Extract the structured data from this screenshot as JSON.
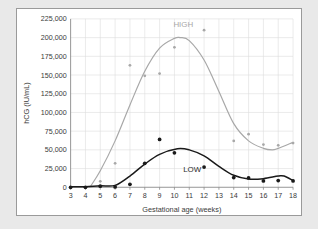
{
  "panel": {
    "background": "#ffffff",
    "border_color": "#9a9a9a",
    "page_background": "#e9e9e9"
  },
  "chart_data": {
    "type": "scatter",
    "title": "",
    "xlabel": "Gestational age (weeks)",
    "ylabel": "hCG (IU/mL)",
    "xlim": [
      3,
      18
    ],
    "ylim": [
      0,
      225000
    ],
    "xticks": [
      3,
      4,
      5,
      6,
      7,
      8,
      9,
      10,
      11,
      12,
      13,
      14,
      15,
      16,
      17,
      18
    ],
    "yticks": [
      0,
      25000,
      50000,
      75000,
      100000,
      125000,
      150000,
      175000,
      200000,
      225000
    ],
    "ytick_labels": [
      "0",
      "25,000",
      "50,000",
      "75,000",
      "100,000",
      "125,000",
      "150,000",
      "175,000",
      "200,000",
      "225,000"
    ],
    "grid": true,
    "grid_color": "#dedede",
    "legend": "inline-annotations",
    "annotations": [
      {
        "text": "HIGH",
        "x": 10.6,
        "y": 214000,
        "color": "#a8a8a8"
      },
      {
        "text": "LOW",
        "x": 11.2,
        "y": 21000,
        "color": "#2b2b2b"
      }
    ],
    "series": [
      {
        "name": "HIGH",
        "color": "#a8a8a8",
        "marker": "dot",
        "x": [
          3,
          4,
          5,
          6,
          7,
          8,
          9,
          10,
          12,
          14,
          15,
          16,
          17,
          18
        ],
        "values": [
          0,
          0,
          8000,
          32000,
          163000,
          149000,
          152000,
          187000,
          210000,
          62000,
          71000,
          57000,
          56000,
          59000
        ],
        "trend": {
          "type": "smooth",
          "x": [
            4.3,
            5,
            6,
            7,
            8,
            9,
            10,
            10.4,
            11,
            12,
            13,
            14,
            15,
            16,
            16.6,
            17,
            18
          ],
          "values": [
            0,
            22000,
            62000,
            110000,
            155000,
            186000,
            199000,
            200000,
            196000,
            170000,
            128000,
            85000,
            62000,
            52000,
            50000,
            52000,
            60000
          ]
        }
      },
      {
        "name": "LOW",
        "color": "#1a1a1a",
        "marker": "dot",
        "x": [
          3,
          4,
          5,
          6,
          7,
          8,
          9,
          10,
          12,
          14,
          15,
          16,
          17,
          18
        ],
        "values": [
          0,
          0,
          1500,
          500,
          4000,
          32000,
          64000,
          46000,
          27000,
          13000,
          12500,
          8500,
          9000,
          8500
        ],
        "trend": {
          "type": "smooth",
          "x": [
            3,
            4,
            5,
            6,
            7,
            8,
            9,
            10.2,
            11,
            12,
            13,
            14,
            15,
            16,
            17,
            17.4,
            18
          ],
          "values": [
            800,
            800,
            2000,
            2500,
            15000,
            31000,
            44000,
            51500,
            50000,
            42000,
            28000,
            16000,
            11000,
            11500,
            15000,
            15000,
            9000
          ]
        }
      }
    ]
  }
}
